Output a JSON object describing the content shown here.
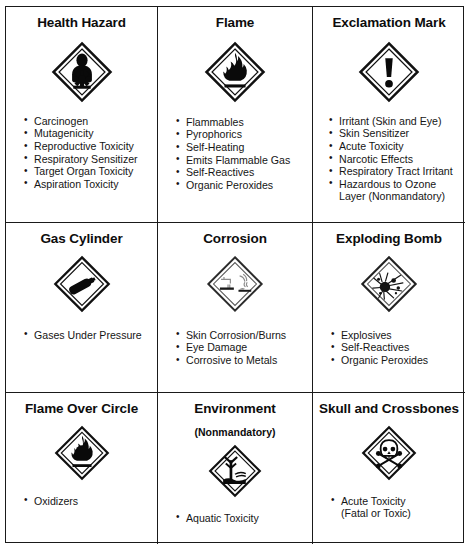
{
  "document": {
    "type": "ghs-pictogram-reference-table",
    "caption": "",
    "columns": 3,
    "rows": 3,
    "border_color": "#1a1a1a",
    "background_color": "#ffffff",
    "text_color": "#111111"
  },
  "cells": [
    {
      "id": "health-hazard",
      "title": "Health Hazard",
      "subtitle": "",
      "icon": "health-hazard-pictogram",
      "icon_style": "solid",
      "bullets": [
        "Carcinogen",
        "Mutagenicity",
        "Reproductive Toxicity",
        "Respiratory Sensitizer",
        "Target Organ Toxicity",
        "Aspiration Toxicity"
      ]
    },
    {
      "id": "flame",
      "title": "Flame",
      "subtitle": "",
      "icon": "flame-pictogram",
      "icon_style": "solid",
      "bullets": [
        "Flammables",
        "Pyrophorics",
        "Self-Heating",
        "Emits Flammable Gas",
        "Self-Reactives",
        "Organic Peroxides"
      ]
    },
    {
      "id": "exclamation-mark",
      "title": "Exclamation Mark",
      "subtitle": "",
      "icon": "exclamation-mark-pictogram",
      "icon_style": "solid",
      "bullets": [
        "Irritant (Skin and Eye)",
        "Skin Sensitizer",
        "Acute Toxicity",
        "Narcotic Effects",
        "Respiratory Tract Irritant",
        "Hazardous to Ozone\nLayer (Nonmandatory)"
      ]
    },
    {
      "id": "gas-cylinder",
      "title": "Gas Cylinder",
      "subtitle": "",
      "icon": "gas-cylinder-pictogram",
      "icon_style": "solid",
      "bullets": [
        "Gases Under Pressure"
      ]
    },
    {
      "id": "corrosion",
      "title": "Corrosion",
      "subtitle": "",
      "icon": "corrosion-pictogram",
      "icon_style": "faded",
      "bullets": [
        "Skin Corrosion/Burns",
        "Eye Damage",
        "Corrosive to Metals"
      ]
    },
    {
      "id": "exploding-bomb",
      "title": "Exploding Bomb",
      "subtitle": "",
      "icon": "exploding-bomb-pictogram",
      "icon_style": "solid",
      "bullets": [
        "Explosives",
        "Self-Reactives",
        "Organic Peroxides"
      ]
    },
    {
      "id": "flame-over-circle",
      "title": "Flame Over Circle",
      "subtitle": "",
      "icon": "flame-over-circle-pictogram",
      "icon_style": "solid",
      "bullets": [
        "Oxidizers"
      ]
    },
    {
      "id": "environment",
      "title": "Environment",
      "subtitle": "(Nonmandatory)",
      "icon": "environment-pictogram",
      "icon_style": "solid",
      "bullets": [
        "Aquatic Toxicity"
      ]
    },
    {
      "id": "skull-and-crossbones",
      "title": "Skull and Crossbones",
      "subtitle": "",
      "icon": "skull-and-crossbones-pictogram",
      "icon_style": "solid",
      "bullets": [
        "Acute Toxicity\n(Fatal or Toxic)"
      ]
    }
  ]
}
